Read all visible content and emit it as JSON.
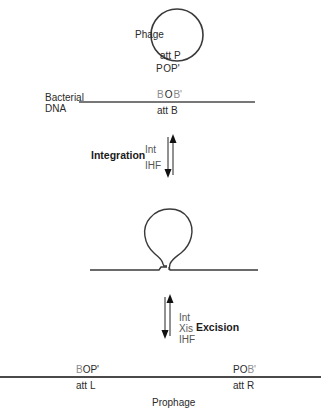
{
  "phage": {
    "label": "Phage",
    "att_label": "att P",
    "site_pre": "P",
    "site_core": "O",
    "site_post": "P'"
  },
  "bacterial": {
    "label_line1": "Bacterial",
    "label_line2": "DNA",
    "site_pre": "B",
    "site_core": "O",
    "site_post": "B'",
    "att_label": "att B"
  },
  "integration": {
    "label": "Integration",
    "factors": [
      "Int",
      "IHF"
    ]
  },
  "excision": {
    "label": "Excision",
    "factors": [
      "Int",
      "Xis",
      "IHF"
    ]
  },
  "prophage": {
    "label": "Prophage",
    "left_site_pre": "B",
    "left_site_core": "O",
    "left_site_post": "P'",
    "left_att": "att L",
    "right_site_pre": "P",
    "right_site_core": "O",
    "right_site_post": "B'",
    "right_att": "att R"
  },
  "colors": {
    "line": "#3a3a3a",
    "phage_site": "#2a2a2a",
    "bacterial_site": "#8a8a8a"
  }
}
